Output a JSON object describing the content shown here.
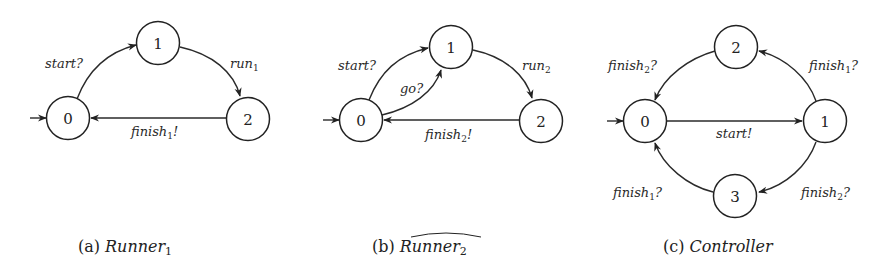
{
  "colors": {
    "stroke": "#222222",
    "background": "#ffffff"
  },
  "figures": [
    {
      "id": "a",
      "caption": {
        "prefix": "(a)",
        "name": "Runner",
        "subscript": "1",
        "hat": false
      },
      "initial_state": "0",
      "nodes": [
        {
          "id": "0",
          "label": "0"
        },
        {
          "id": "1",
          "label": "1"
        },
        {
          "id": "2",
          "label": "2"
        }
      ],
      "edges": [
        {
          "from": "0",
          "to": "1",
          "label": "start?",
          "base": "start?",
          "sub": "",
          "suffix": ""
        },
        {
          "from": "1",
          "to": "2",
          "label": "run1",
          "base": "run",
          "sub": "1",
          "suffix": ""
        },
        {
          "from": "2",
          "to": "0",
          "label": "finish1!",
          "base": "finish",
          "sub": "1",
          "suffix": "!"
        }
      ]
    },
    {
      "id": "b",
      "caption": {
        "prefix": "(b)",
        "name": "Runner",
        "subscript": "2",
        "hat": true
      },
      "initial_state": "0",
      "nodes": [
        {
          "id": "0",
          "label": "0"
        },
        {
          "id": "1",
          "label": "1"
        },
        {
          "id": "2",
          "label": "2"
        }
      ],
      "edges": [
        {
          "from": "0",
          "to": "1",
          "label": "start?",
          "base": "start?",
          "sub": "",
          "suffix": ""
        },
        {
          "from": "0",
          "to": "1",
          "label": "go?",
          "base": "go?",
          "sub": "",
          "suffix": ""
        },
        {
          "from": "1",
          "to": "2",
          "label": "run2",
          "base": "run",
          "sub": "2",
          "suffix": ""
        },
        {
          "from": "2",
          "to": "0",
          "label": "finish2!",
          "base": "finish",
          "sub": "2",
          "suffix": "!"
        }
      ]
    },
    {
      "id": "c",
      "caption": {
        "prefix": "(c)",
        "name": "Controller",
        "subscript": "",
        "hat": false
      },
      "initial_state": "0",
      "nodes": [
        {
          "id": "0",
          "label": "0"
        },
        {
          "id": "1",
          "label": "1"
        },
        {
          "id": "2",
          "label": "2"
        },
        {
          "id": "3",
          "label": "3"
        }
      ],
      "edges": [
        {
          "from": "0",
          "to": "1",
          "label": "start!",
          "base": "start!",
          "sub": "",
          "suffix": ""
        },
        {
          "from": "1",
          "to": "2",
          "label": "finish1?",
          "base": "finish",
          "sub": "1",
          "suffix": "?"
        },
        {
          "from": "2",
          "to": "0",
          "label": "finish2?",
          "base": "finish",
          "sub": "2",
          "suffix": "?"
        },
        {
          "from": "1",
          "to": "3",
          "label": "finish2?",
          "base": "finish",
          "sub": "2",
          "suffix": "?"
        },
        {
          "from": "3",
          "to": "0",
          "label": "finish1?",
          "base": "finish",
          "sub": "1",
          "suffix": "?"
        }
      ]
    }
  ]
}
